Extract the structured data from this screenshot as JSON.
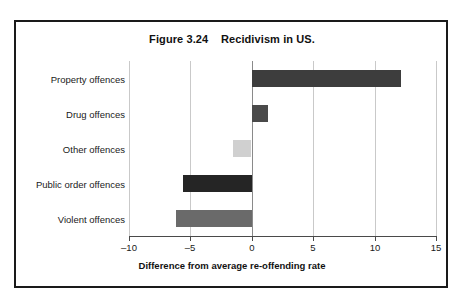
{
  "figure": {
    "title": "Figure 3.24    Recidivism in US.",
    "frame_color": "#1a1a1a",
    "background": "#ffffff"
  },
  "chart_data": {
    "type": "bar",
    "orientation": "horizontal",
    "title": "Figure 3.24    Recidivism in US.",
    "categories": [
      "Property offences",
      "Drug offences",
      "Other offences",
      "Public order offences",
      "Violent offences"
    ],
    "values": [
      12.1,
      1.3,
      -1.5,
      -5.6,
      -6.2
    ],
    "bar_colors": [
      "#3d3d3d",
      "#4a4a4a",
      "#d0d0d0",
      "#252525",
      "#6a6a6a"
    ],
    "xlabel": "Difference from average re-offending rate",
    "ylabel": "",
    "xlim": [
      -10,
      15
    ],
    "xticks": [
      -10,
      -5,
      0,
      5,
      10,
      15
    ],
    "xticklabels": [
      "–10",
      "–5",
      "0",
      "5",
      "10",
      "15"
    ],
    "grid": true,
    "grid_axis": "x",
    "legend": false,
    "zero_line": 0
  },
  "axis": {
    "x_title": "Difference from average re-offending rate",
    "tick_labels": [
      "–10",
      "–5",
      "0",
      "5",
      "10",
      "15"
    ]
  }
}
